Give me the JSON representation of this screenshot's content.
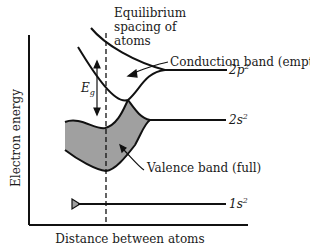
{
  "diagram": {
    "type": "energy-band-diagram",
    "axes": {
      "y_label": "Electron energy",
      "x_label": "Distance between atoms"
    },
    "annotations": {
      "equilibrium_line": [
        "Equilibrium",
        "spacing of",
        "atoms"
      ],
      "conduction_band": "Conduction band (empty)",
      "valence_band": "Valence band (full)",
      "band_gap": "E",
      "band_gap_sub": "g"
    },
    "levels": [
      {
        "name": "2p",
        "sup": "2"
      },
      {
        "name": "2s",
        "sup": "2"
      },
      {
        "name": "1s",
        "sup": "2"
      }
    ],
    "colors": {
      "line": "#111111",
      "fill": "#a0a0a0"
    }
  }
}
